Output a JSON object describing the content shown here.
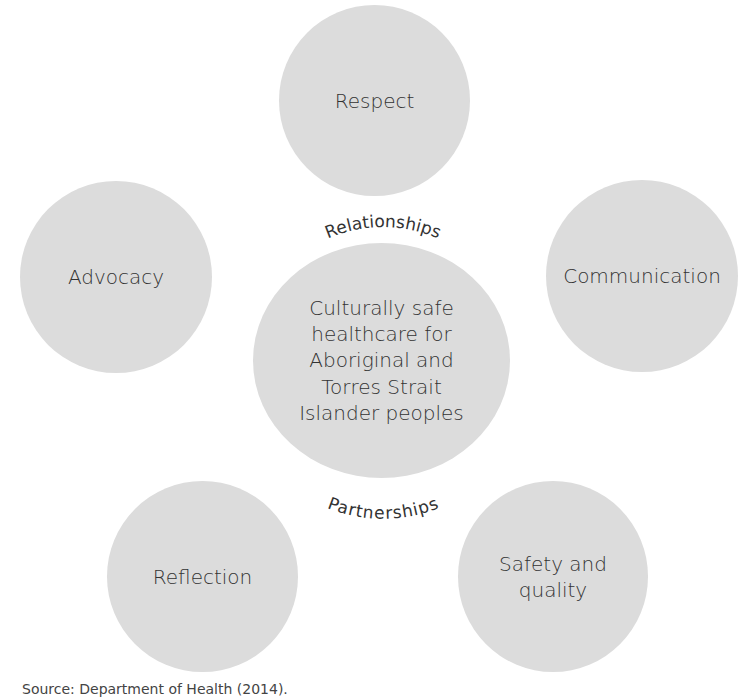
{
  "diagram": {
    "center": {
      "label_lines": [
        "Culturally safe",
        "healthcare for",
        "Aboriginal and",
        "Torres Strait",
        "Islander peoples"
      ]
    },
    "nodes": [
      {
        "id": "respect",
        "label": "Respect"
      },
      {
        "id": "advocacy",
        "label": "Advocacy"
      },
      {
        "id": "communication",
        "label": "Communication"
      },
      {
        "id": "reflection",
        "label": "Reflection"
      },
      {
        "id": "safety-quality",
        "label_lines": [
          "Safety and",
          "quality"
        ]
      }
    ],
    "arc_labels": {
      "top": "Relationships",
      "bottom": "Partnerships"
    },
    "source": "Source: Department of Health (2014).",
    "colors": {
      "circle_fill": "#dcdcdc",
      "text": "#333333",
      "background": "#ffffff"
    }
  }
}
